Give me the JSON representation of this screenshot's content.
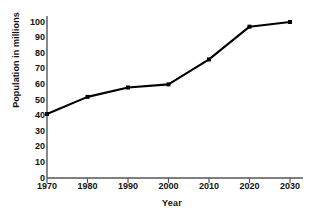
{
  "chart_data": {
    "type": "line",
    "title": "",
    "xlabel": "Year",
    "ylabel": "Population in millions",
    "x": [
      1970,
      1980,
      1990,
      2000,
      2010,
      2020,
      2030
    ],
    "categories": [
      "1970",
      "1980",
      "1990",
      "2000",
      "2010",
      "2020",
      "2030"
    ],
    "values": [
      41,
      52,
      58,
      60,
      76,
      97,
      100
    ],
    "series": [
      {
        "name": "Population",
        "values": [
          41,
          52,
          58,
          60,
          76,
          97,
          100
        ]
      }
    ],
    "xlim": [
      1970,
      2030
    ],
    "ylim": [
      0,
      100
    ],
    "xticks": [
      "1970",
      "1980",
      "1990",
      "2000",
      "2010",
      "2020",
      "2030"
    ],
    "yticks": [
      "0",
      "10",
      "20",
      "30",
      "40",
      "50",
      "60",
      "70",
      "80",
      "90",
      "100"
    ],
    "grid": false,
    "legend": null,
    "marker": "square",
    "line_color": "#000000",
    "marker_color": "#000000",
    "background_color": "#ffffff",
    "axis_color": "#555555"
  }
}
